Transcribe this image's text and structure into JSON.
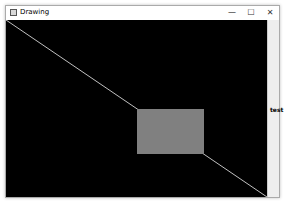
{
  "window": {
    "title": "Drawing",
    "controls": {
      "minimize": "—",
      "maximize": "☐",
      "close": "✕"
    }
  },
  "canvas": {
    "background": "#000000",
    "line": {
      "x1": 0,
      "y1": 0,
      "x2": 261,
      "y2": 177,
      "color": "#c0c0c0"
    },
    "rectangle": {
      "x": 131,
      "y": 89,
      "width": 67,
      "height": 45,
      "fill": "#808080"
    }
  },
  "side_panel": {
    "label": "test"
  }
}
